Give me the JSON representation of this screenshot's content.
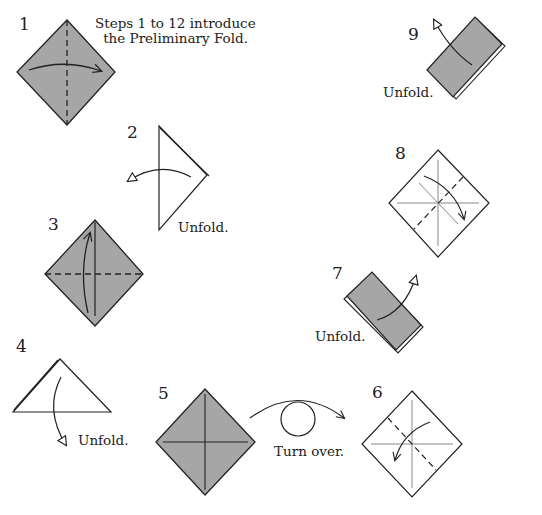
{
  "title": "Preliminary Fold",
  "intro": {
    "line1": "Steps 1 to 12 introduce",
    "line2": "the Preliminary Fold."
  },
  "colors": {
    "paper_colored": "#a6a6a6",
    "paper_white": "#ffffff",
    "line": "#222222",
    "crease": "#888888"
  },
  "steps": [
    {
      "number": "1",
      "instruction": ""
    },
    {
      "number": "2",
      "instruction": "Unfold."
    },
    {
      "number": "3",
      "instruction": ""
    },
    {
      "number": "4",
      "instruction": "Unfold."
    },
    {
      "number": "5",
      "instruction": "Turn over."
    },
    {
      "number": "6",
      "instruction": ""
    },
    {
      "number": "7",
      "instruction": "Unfold."
    },
    {
      "number": "8",
      "instruction": ""
    },
    {
      "number": "9",
      "instruction": "Unfold."
    }
  ]
}
